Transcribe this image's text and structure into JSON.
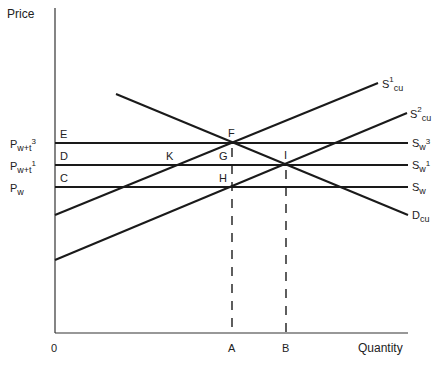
{
  "axes": {
    "y_title": "Price",
    "x_title": "Quantity",
    "origin": "0",
    "x_ticks": [
      "A",
      "B"
    ],
    "y_ticks": [
      {
        "base": "P",
        "sub": "w+t",
        "sup": "3"
      },
      {
        "base": "P",
        "sub": "w+t",
        "sup": "1"
      },
      {
        "base": "P",
        "sub": "w",
        "sup": ""
      }
    ]
  },
  "curves": {
    "s1cu": {
      "base": "S",
      "sup": "1",
      "sub": "cu"
    },
    "s2cu": {
      "base": "S",
      "sup": "2",
      "sub": "cu"
    },
    "sw3": {
      "base": "S",
      "sub": "w",
      "sup": "3"
    },
    "sw1": {
      "base": "S",
      "sub": "w",
      "sup": "1"
    },
    "sw": {
      "base": "S",
      "sub": "w",
      "sup": ""
    },
    "dcu": {
      "base": "D",
      "sub": "cu",
      "sup": ""
    }
  },
  "points": {
    "E": "E",
    "D": "D",
    "C": "C",
    "F": "F",
    "G": "G",
    "H": "H",
    "I": "I",
    "K": "K"
  }
}
